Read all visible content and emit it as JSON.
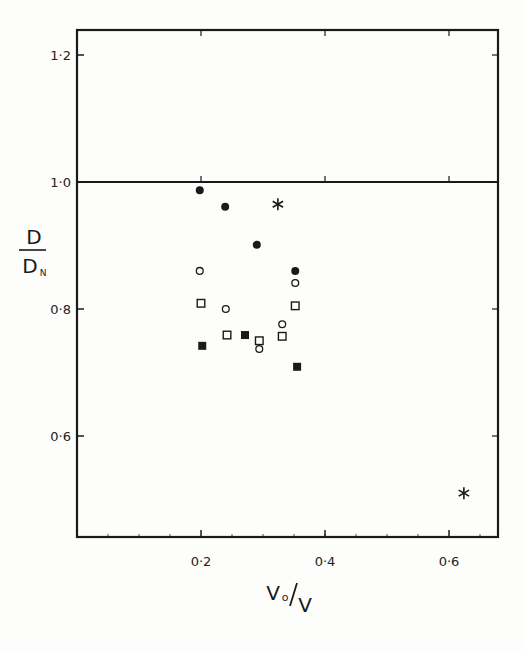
{
  "chart_data": {
    "type": "scatter",
    "title": "",
    "xlabel": "V₀/V",
    "ylabel": "D/D_N",
    "xlabel_parts": {
      "num": "V",
      "sub": "o",
      "slash": "/",
      "den": "V"
    },
    "ylabel_parts": {
      "num": "D",
      "den": "D",
      "sub": "N"
    },
    "xlim": [
      0.0,
      0.68
    ],
    "ylim": [
      0.47,
      1.24
    ],
    "grid": false,
    "legend": null,
    "reference_lines": [
      {
        "orientation": "horizontal",
        "y": 1.0
      }
    ],
    "x_ticks": [
      {
        "value": 0.2,
        "label": "0·2"
      },
      {
        "value": 0.4,
        "label": "0·4"
      },
      {
        "value": 0.6,
        "label": "0·6"
      }
    ],
    "y_ticks": [
      {
        "value": 0.6,
        "label": "0·6"
      },
      {
        "value": 0.8,
        "label": "0·8"
      },
      {
        "value": 1.0,
        "label": "1·0"
      },
      {
        "value": 1.2,
        "label": "1·2"
      }
    ],
    "series": [
      {
        "name": "filled circles",
        "marker": "filled-circle",
        "points": [
          {
            "x": 0.198,
            "y": 0.987
          },
          {
            "x": 0.239,
            "y": 0.961
          },
          {
            "x": 0.29,
            "y": 0.901
          },
          {
            "x": 0.352,
            "y": 0.86
          }
        ]
      },
      {
        "name": "open circles",
        "marker": "open-circle",
        "points": [
          {
            "x": 0.198,
            "y": 0.86
          },
          {
            "x": 0.24,
            "y": 0.8
          },
          {
            "x": 0.294,
            "y": 0.737
          },
          {
            "x": 0.331,
            "y": 0.776
          },
          {
            "x": 0.352,
            "y": 0.841
          }
        ]
      },
      {
        "name": "open squares",
        "marker": "open-square",
        "points": [
          {
            "x": 0.2,
            "y": 0.809
          },
          {
            "x": 0.242,
            "y": 0.759
          },
          {
            "x": 0.294,
            "y": 0.75
          },
          {
            "x": 0.331,
            "y": 0.757
          },
          {
            "x": 0.352,
            "y": 0.805
          }
        ]
      },
      {
        "name": "filled squares",
        "marker": "filled-square",
        "points": [
          {
            "x": 0.202,
            "y": 0.742
          },
          {
            "x": 0.271,
            "y": 0.759
          },
          {
            "x": 0.355,
            "y": 0.709
          }
        ]
      },
      {
        "name": "asterisks",
        "marker": "asterisk",
        "points": [
          {
            "x": 0.324,
            "y": 0.965
          },
          {
            "x": 0.624,
            "y": 0.51
          }
        ]
      }
    ]
  },
  "colors": {
    "ink": "#1a1a1a",
    "paper": "#fdfdfb"
  }
}
